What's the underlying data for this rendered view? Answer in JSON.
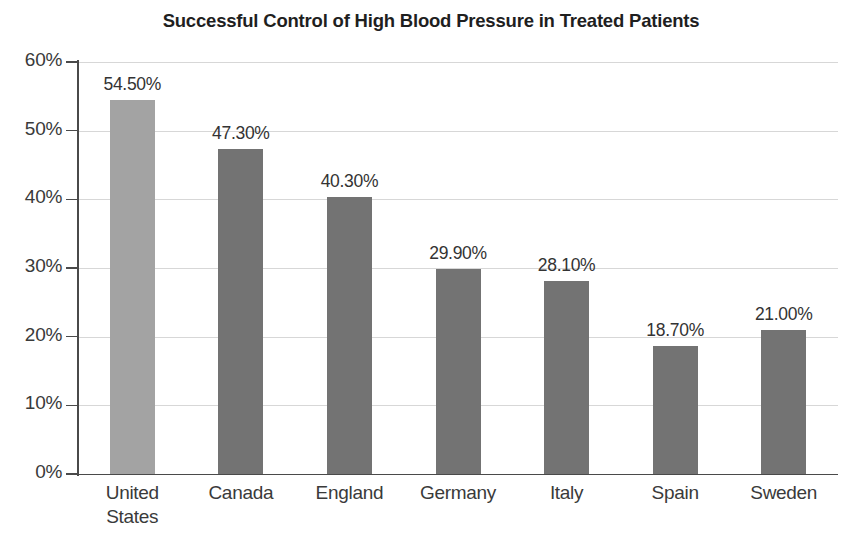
{
  "chart_data": {
    "type": "bar",
    "title": "Successful Control of High Blood Pressure in Treated Patients",
    "xlabel": "",
    "ylabel": "",
    "ylim": [
      0,
      60
    ],
    "grid": true,
    "legend": "none",
    "categories": [
      "United States",
      "Canada",
      "England",
      "Germany",
      "Italy",
      "Spain",
      "Sweden"
    ],
    "category_lines": [
      [
        "United",
        "States"
      ],
      [
        "Canada"
      ],
      [
        "England"
      ],
      [
        "Germany"
      ],
      [
        "Italy"
      ],
      [
        "Spain"
      ],
      [
        "Sweden"
      ]
    ],
    "values": [
      54.5,
      47.3,
      40.3,
      29.9,
      28.1,
      18.7,
      21.0
    ],
    "value_labels": [
      "54.50%",
      "47.30%",
      "40.30%",
      "29.90%",
      "28.10%",
      "18.70%",
      "21.00%"
    ],
    "bar_colors": [
      "#a3a3a3",
      "#737373",
      "#737373",
      "#737373",
      "#737373",
      "#737373",
      "#737373"
    ],
    "ytick_values": [
      0,
      10,
      20,
      30,
      40,
      50,
      60
    ],
    "ytick_labels": [
      "0%",
      "10%",
      "20%",
      "30%",
      "40%",
      "50%",
      "60%"
    ]
  },
  "colors": {
    "background": "#ffffff",
    "axis": "#4a4a4a",
    "gridline": "#d7d7d7",
    "text": "#3a3a3a",
    "title": "#1f1f1f",
    "bar_highlight": "#a3a3a3",
    "bar_default": "#737373"
  },
  "footer": {
    "partial_text": ""
  }
}
